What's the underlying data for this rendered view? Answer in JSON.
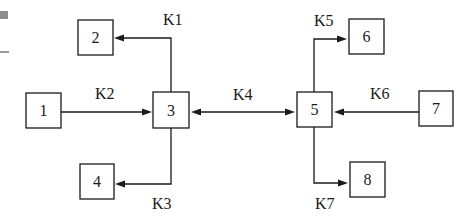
{
  "diagram": {
    "nodes": [
      {
        "id": "1",
        "label": "1",
        "x": 26,
        "y": 93,
        "w": 35,
        "h": 35
      },
      {
        "id": "2",
        "label": "2",
        "x": 78,
        "y": 20,
        "w": 35,
        "h": 35
      },
      {
        "id": "3",
        "label": "3",
        "x": 153,
        "y": 92,
        "w": 36,
        "h": 36
      },
      {
        "id": "4",
        "label": "4",
        "x": 80,
        "y": 164,
        "w": 34,
        "h": 35
      },
      {
        "id": "5",
        "label": "5",
        "x": 297,
        "y": 92,
        "w": 35,
        "h": 35
      },
      {
        "id": "6",
        "label": "6",
        "x": 349,
        "y": 19,
        "w": 35,
        "h": 35
      },
      {
        "id": "7",
        "label": "7",
        "x": 419,
        "y": 91,
        "w": 34,
        "h": 35
      },
      {
        "id": "8",
        "label": "8",
        "x": 350,
        "y": 162,
        "w": 35,
        "h": 35
      }
    ],
    "edges": [
      {
        "id": "K1",
        "label": "K1",
        "from": "3",
        "to": "2",
        "direction": "one-way"
      },
      {
        "id": "K2",
        "label": "K2",
        "from": "1",
        "to": "3",
        "direction": "one-way"
      },
      {
        "id": "K3",
        "label": "K3",
        "from": "3",
        "to": "4",
        "direction": "one-way"
      },
      {
        "id": "K4",
        "label": "K4",
        "from": "3",
        "to": "5",
        "direction": "two-way"
      },
      {
        "id": "K5",
        "label": "K5",
        "from": "5",
        "to": "6",
        "direction": "one-way"
      },
      {
        "id": "K6",
        "label": "K6",
        "from": "7",
        "to": "5",
        "direction": "one-way"
      },
      {
        "id": "K7",
        "label": "K7",
        "from": "5",
        "to": "8",
        "direction": "one-way"
      }
    ]
  }
}
